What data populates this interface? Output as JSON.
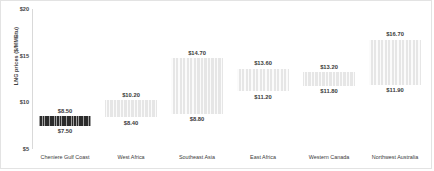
{
  "chart_data": {
    "type": "bar",
    "title": "",
    "subtitle": "",
    "xlabel": "",
    "ylabel": "LNG prices ($/MMBtu)",
    "ylim": [
      5,
      20
    ],
    "yticks": [
      "$5",
      "$10",
      "$15",
      "$20"
    ],
    "ytick_values": [
      5,
      10,
      15,
      20
    ],
    "grid": false,
    "legend": null,
    "categories": [
      "Cheniere Gulf Coast",
      "West Africa",
      "Southeast Asia",
      "East Africa",
      "Western Canada",
      "Northwest Australia"
    ],
    "series": [
      {
        "name": "High estimate",
        "values": [
          8.5,
          10.2,
          14.7,
          13.6,
          13.2,
          16.7
        ],
        "labels": [
          "$8.50",
          "$10.20",
          "$14.70",
          "$13.60",
          "$13.20",
          "$16.70"
        ]
      },
      {
        "name": "Low estimate",
        "values": [
          7.5,
          8.4,
          8.8,
          11.2,
          11.8,
          11.9
        ],
        "labels": [
          "$7.50",
          "$8.40",
          "$8.80",
          "$11.20",
          "$11.80",
          "$11.90"
        ]
      }
    ],
    "bar_styles": [
      "dark",
      "light",
      "light",
      "light",
      "light",
      "light"
    ],
    "colors": {
      "dark_bar": "#2b2b2b",
      "light_bar": "#e6e6e6",
      "axis": "#d9d9d9",
      "text": "#3a3a3a",
      "border": "#e3e3e3",
      "background": "#ffffff"
    }
  }
}
